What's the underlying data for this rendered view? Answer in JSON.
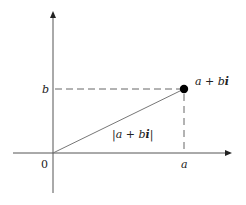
{
  "diagram": {
    "colors": {
      "background": "#ffffff",
      "axis": "#555555",
      "line": "#777777",
      "point": "#000000",
      "text": "#222222"
    },
    "labels": {
      "origin": "0",
      "x_tick": "a",
      "y_tick": "b",
      "point_label_a": "a",
      "point_label_plus": " + ",
      "point_label_b": "b",
      "point_label_i": "i",
      "modulus_bar_left": "|",
      "modulus_a": "a",
      "modulus_plus": " + ",
      "modulus_b": "b",
      "modulus_i": "i",
      "modulus_bar_right": "|"
    },
    "geometry": {
      "origin": [
        53,
        153
      ],
      "point": [
        184,
        89
      ],
      "x_axis": {
        "from": 13,
        "to": 232
      },
      "y_axis": {
        "from": 193,
        "to": 11
      }
    }
  }
}
